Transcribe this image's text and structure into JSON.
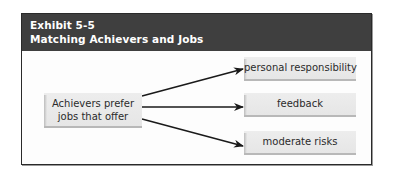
{
  "exhibit": {
    "label": "Exhibit 5-5",
    "title": "Matching Achievers and Jobs",
    "header_color": "#3f3f3f"
  },
  "diagram": {
    "source": {
      "line1": "Achievers prefer",
      "line2": "jobs that offer"
    },
    "targets": [
      {
        "label": "personal responsibility"
      },
      {
        "label": "feedback"
      },
      {
        "label": "moderate risks"
      }
    ],
    "connector": "arrow",
    "arrow_color": "#1a1a1a"
  }
}
